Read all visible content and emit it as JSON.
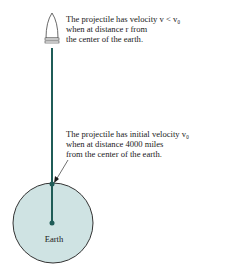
{
  "figure": {
    "projectile_caption": {
      "line1": "The projectile has velocity v < v₀",
      "line2": "when at distance r from",
      "line3": "the center of the earth."
    },
    "launch_caption": {
      "line1": "The projectile has initial velocity v₀",
      "line2": "when at distance 4000 miles",
      "line3": "from the center of the earth."
    },
    "earth_label": "Earth",
    "colors": {
      "trajectory": "#1f5c57",
      "earth_fill": "#cfe3e3",
      "outline": "#333333"
    }
  }
}
